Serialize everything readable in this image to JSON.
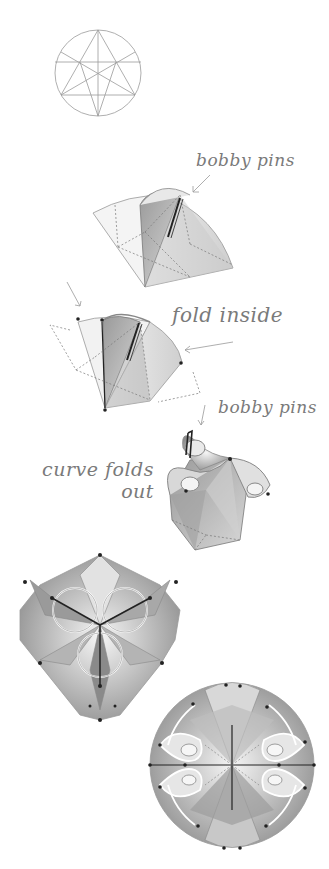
{
  "diagram": {
    "type": "folding-instructions",
    "steps": [
      {
        "id": 1,
        "description": "circle with crease pattern (star of lines)"
      },
      {
        "id": 2,
        "description": "fan fold secured with bobby pins"
      },
      {
        "id": 3,
        "description": "fold inside"
      },
      {
        "id": 4,
        "description": "curve folds out, bobby pins"
      },
      {
        "id": 5,
        "description": "assembled three-lobed module"
      },
      {
        "id": 6,
        "description": "assembled four-lobed sphere"
      }
    ],
    "labels": {
      "bobby_pins_1": "bobby pins",
      "fold_inside": "fold inside",
      "bobby_pins_2": "bobby pins",
      "curve_folds_out": "curve folds\nout"
    },
    "colors": {
      "line": "#8a8a8a",
      "dark": "#333333",
      "fill_light": "#e6e6e6",
      "fill_mid": "#bdbdbd",
      "fill_dark": "#8e8e8e"
    }
  }
}
